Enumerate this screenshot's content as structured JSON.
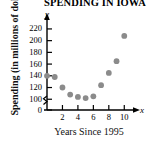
{
  "chart_data": {
    "type": "scatter",
    "title": "SPENDING IN IOWA",
    "xlabel": "Years Since 1995",
    "ylabel": "Spending (in millions of dollars)",
    "x_axis_name": "x",
    "y_axis_name": "y",
    "x": [
      0,
      1,
      2,
      3,
      4,
      5,
      6,
      7,
      8,
      9,
      10
    ],
    "values": [
      140,
      138,
      120,
      108,
      104,
      102,
      105,
      124,
      145,
      165,
      208
    ],
    "xlim": [
      0,
      11
    ],
    "ylim": [
      90,
      230
    ],
    "y_axis_broken": true,
    "y_break_between": [
      0,
      100
    ],
    "xticks": [
      2,
      4,
      6,
      8,
      10
    ],
    "yticks": [
      0,
      100,
      120,
      140,
      160,
      180,
      200,
      220
    ],
    "grid": false,
    "legend": "none",
    "point_color": "#8b8b8b",
    "axis_color": "#000000"
  }
}
